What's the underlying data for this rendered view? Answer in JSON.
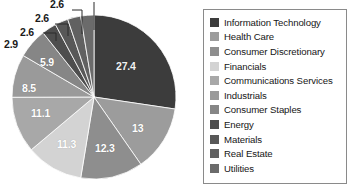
{
  "chart_data": {
    "type": "pie",
    "title": "",
    "xlabel": "",
    "ylabel": "",
    "legend_position": "right",
    "grid": false,
    "units": "percent",
    "categories": [
      "Information Technology",
      "Health Care",
      "Consumer Discretionary",
      "Financials",
      "Communications Services",
      "Industrials",
      "Consumer Staples",
      "Energy",
      "Materials",
      "Real Estate",
      "Utilities"
    ],
    "values": [
      27.4,
      13,
      12.3,
      11.3,
      11.1,
      8.5,
      5.9,
      2.9,
      2.6,
      2.6,
      2.6
    ],
    "colors": [
      "#3c3c3c",
      "#9c9c9c",
      "#8e8e8e",
      "#d3d3d3",
      "#a8a8a8",
      "#9a9a9a",
      "#868686",
      "#4e4e4e",
      "#585858",
      "#616161",
      "#6b6b6b"
    ],
    "labels": [
      {
        "value": "27.4",
        "placement": "inside"
      },
      {
        "value": "13",
        "placement": "inside"
      },
      {
        "value": "12.3",
        "placement": "inside"
      },
      {
        "value": "11.3",
        "placement": "inside"
      },
      {
        "value": "11.1",
        "placement": "inside"
      },
      {
        "value": "8.5",
        "placement": "inside"
      },
      {
        "value": "5.9",
        "placement": "inside"
      },
      {
        "value": "2.9",
        "placement": "callout"
      },
      {
        "value": "2.6",
        "placement": "callout"
      },
      {
        "value": "2.6",
        "placement": "callout"
      },
      {
        "value": "2.6",
        "placement": "callout-cropped"
      }
    ]
  },
  "slice_labels": {
    "l0": "27.4",
    "l1": "13",
    "l2": "12.3",
    "l3": "11.3",
    "l4": "11.1",
    "l5": "8.5",
    "l6": "5.9"
  },
  "callouts": {
    "c0": "2.9",
    "c1": "2.6",
    "c2": "2.6"
  },
  "legend": {
    "items": [
      {
        "label": "Information Technology",
        "color": "#3c3c3c"
      },
      {
        "label": "Health Care",
        "color": "#9c9c9c"
      },
      {
        "label": "Consumer Discretionary",
        "color": "#8e8e8e"
      },
      {
        "label": "Financials",
        "color": "#d3d3d3"
      },
      {
        "label": "Communications Services",
        "color": "#a8a8a8"
      },
      {
        "label": "Industrials",
        "color": "#9a9a9a"
      },
      {
        "label": "Consumer Staples",
        "color": "#868686"
      },
      {
        "label": "Energy",
        "color": "#4e4e4e"
      },
      {
        "label": "Materials",
        "color": "#585858"
      },
      {
        "label": "Real Estate",
        "color": "#616161"
      },
      {
        "label": "Utilities",
        "color": "#6b6b6b"
      }
    ]
  }
}
